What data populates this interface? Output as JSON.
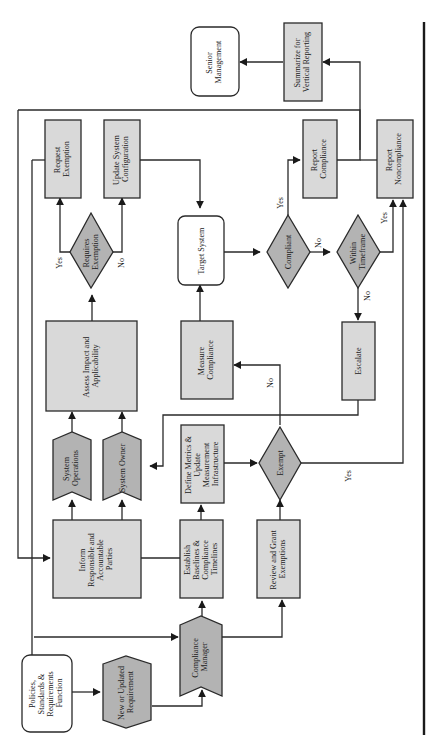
{
  "diagram": {
    "orientation": "rotated-90-ccw",
    "colors": {
      "process_fill": "#d9d9d9",
      "role_fill": "#b3b3b3",
      "terminal_fill": "#ffffff",
      "stroke": "#2a2a2a"
    },
    "nodes": {
      "policies": {
        "lines": [
          "Policies,",
          "Standards &",
          "Requirements",
          "Function"
        ],
        "shape": "rounded-rect"
      },
      "new_req": {
        "lines": [
          "New or Updated",
          "Requirement"
        ],
        "shape": "hexagon"
      },
      "compliance_manager": {
        "lines": [
          "Compliance",
          "Manager"
        ],
        "shape": "chevron"
      },
      "inform": {
        "lines": [
          "Inform",
          "Responsible and",
          "Accountable",
          "Parties"
        ],
        "shape": "rect"
      },
      "establish": {
        "lines": [
          "Establish",
          "Baselines &",
          "Compliance",
          "Timelines"
        ],
        "shape": "rect"
      },
      "review": {
        "lines": [
          "Review and Grant",
          "Exemptions"
        ],
        "shape": "rect"
      },
      "sys_ops": {
        "lines": [
          "System",
          "Operations"
        ],
        "shape": "chevron"
      },
      "sys_owner": {
        "lines": [
          "System Owner"
        ],
        "shape": "chevron"
      },
      "define": {
        "lines": [
          "Define Metrics &",
          "Update",
          "Measurement",
          "Infrastructure"
        ],
        "shape": "rect"
      },
      "exempt": {
        "lines": [
          "Exempt"
        ],
        "shape": "diamond"
      },
      "assess": {
        "lines": [
          "Assess Impact and",
          "Applicability"
        ],
        "shape": "rect"
      },
      "measure": {
        "lines": [
          "Measure",
          "Compliance"
        ],
        "shape": "rect"
      },
      "escalate": {
        "lines": [
          "Escalate"
        ],
        "shape": "rect"
      },
      "requires_exemption": {
        "lines": [
          "Requires",
          "Exemption"
        ],
        "shape": "diamond"
      },
      "target_system": {
        "lines": [
          "Target System"
        ],
        "shape": "rounded-rect"
      },
      "compliant": {
        "lines": [
          "Compliant"
        ],
        "shape": "diamond"
      },
      "within_timeframe": {
        "lines": [
          "Within",
          "Timeframe"
        ],
        "shape": "diamond"
      },
      "request_exemption": {
        "lines": [
          "Request",
          "Exemption"
        ],
        "shape": "rect"
      },
      "update_config": {
        "lines": [
          "Update System",
          "Configuration"
        ],
        "shape": "rect"
      },
      "report_compliance": {
        "lines": [
          "Report",
          "Compliance"
        ],
        "shape": "rect"
      },
      "report_noncompliance": {
        "lines": [
          "Report",
          "Noncompliance"
        ],
        "shape": "rect"
      },
      "senior_mgmt": {
        "lines": [
          "Senior",
          "Management"
        ],
        "shape": "rounded-rect"
      },
      "summarize": {
        "lines": [
          "Summarize for",
          "Vertical Reporting"
        ],
        "shape": "rect"
      }
    },
    "edge_labels": {
      "req_yes": "Yes",
      "req_no": "No",
      "compliant_yes": "Yes",
      "compliant_no": "No",
      "timeframe_yes": "Yes",
      "timeframe_no": "No",
      "exempt_yes": "Yes",
      "exempt_no": "No"
    }
  }
}
